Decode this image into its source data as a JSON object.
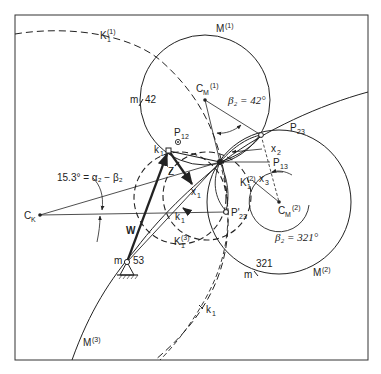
{
  "diagram": {
    "type": "kinematic-synthesis-construction",
    "labels": {
      "K1_1": {
        "base": "K",
        "sub": "1",
        "sup": "(1)"
      },
      "M1": {
        "base": "M",
        "sup": "(1)"
      },
      "M2": {
        "base": "M",
        "sup": "(2)"
      },
      "M3": {
        "base": "M",
        "sup": "(3)"
      },
      "CM1": {
        "base": "C",
        "sub": "M",
        "sup": "(1)"
      },
      "CM2": {
        "base": "C",
        "sub": "M",
        "sup": "(2)"
      },
      "CK": {
        "base": "C",
        "sub": "K"
      },
      "P12": {
        "base": "P",
        "sub": "12"
      },
      "P13": {
        "base": "P",
        "sub": "13"
      },
      "P23": {
        "base": "P",
        "sub": "23"
      },
      "P23prime": {
        "base": "P'",
        "sub": "23"
      },
      "K1_2": {
        "base": "K",
        "sub": "1",
        "sup": "(2)"
      },
      "K1_3": {
        "base": "K",
        "sub": "1",
        "sup": "(3)"
      },
      "k1_top": {
        "base": "k",
        "sub": "1"
      },
      "k1_mid": {
        "base": "k",
        "sub": "1"
      },
      "k1_low": {
        "base": "k",
        "sub": "1"
      },
      "x1": {
        "base": "x",
        "sub": "1"
      },
      "x2": {
        "base": "x",
        "sub": "2"
      },
      "x3": {
        "base": "x",
        "sub": "3"
      },
      "Z": "Z",
      "W": "W",
      "m42": {
        "m": "m",
        "value": "42"
      },
      "m53": {
        "m": "m",
        "value": "53"
      },
      "m321": {
        "m": "m",
        "value": "321"
      },
      "angle_top": "β₂ = 42°",
      "angle_bottom": "β₂ = 321°",
      "angle_left": "15.3° = α₂ − β₂"
    },
    "colors": {
      "ink": "#222222",
      "background": "#ffffff"
    }
  }
}
